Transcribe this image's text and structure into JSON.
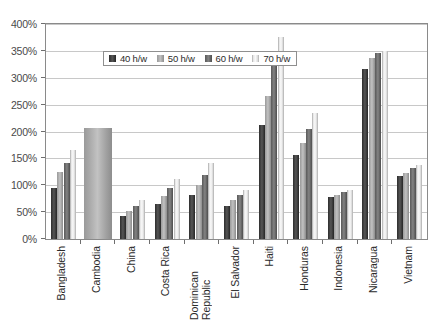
{
  "chart_data": {
    "type": "bar",
    "title": "",
    "xlabel": "",
    "ylabel": "",
    "ylim": [
      0,
      400
    ],
    "ytick_step": 50,
    "grid": true,
    "legend_position": "top-left inside plot",
    "ytick_labels": [
      "0%",
      "50%",
      "100%",
      "150%",
      "200%",
      "250%",
      "300%",
      "350%",
      "400%"
    ],
    "categories": [
      "Bangladesh",
      "Cambodia",
      "China",
      "Costa Rica",
      "Dominican Republic",
      "El Salvador",
      "Haiti",
      "Honduras",
      "Indonesia",
      "Nicaragua",
      "Vietnam"
    ],
    "series": [
      {
        "name": "40 h/w",
        "color": "#3a3a3a",
        "values": [
          95,
          207,
          42,
          65,
          81,
          62,
          212,
          157,
          78,
          317,
          118
        ]
      },
      {
        "name": "50 h/w",
        "color": "#b0b0b0",
        "values": [
          125,
          207,
          52,
          80,
          100,
          72,
          267,
          178,
          82,
          337,
          122
        ]
      },
      {
        "name": "60 h/w",
        "color": "#6e6e6e",
        "values": [
          142,
          207,
          62,
          95,
          120,
          82,
          322,
          205,
          88,
          347,
          132
        ]
      },
      {
        "name": "70 h/w",
        "color": "#ededed",
        "values": [
          165,
          207,
          73,
          112,
          142,
          92,
          375,
          235,
          92,
          350,
          138
        ]
      }
    ]
  },
  "legend": {
    "items": [
      {
        "label": "40 h/w"
      },
      {
        "label": "50 h/w"
      },
      {
        "label": "60 h/w"
      },
      {
        "label": "70 h/w"
      }
    ]
  }
}
